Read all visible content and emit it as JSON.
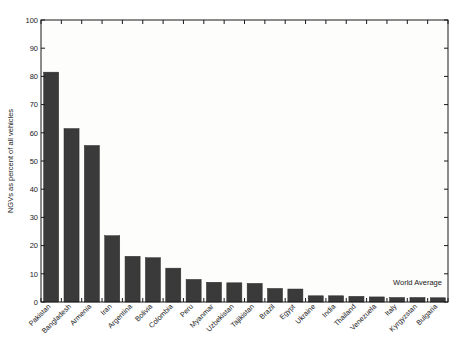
{
  "chart_data": {
    "type": "bar",
    "title": "",
    "xlabel": "",
    "ylabel": "NGVs as percent of all vehicles",
    "ylim": [
      0,
      100
    ],
    "yticks": [
      0,
      10,
      20,
      30,
      40,
      50,
      60,
      70,
      80,
      90,
      100
    ],
    "ytick_labels": [
      "0",
      "10",
      "20",
      "30",
      "40",
      "50",
      "60",
      "70",
      "80",
      "90",
      "100"
    ],
    "grid": false,
    "legend": null,
    "bar_color": "#3a3a3a",
    "categories": [
      "Pakistan",
      "Bangladesh",
      "Armenia",
      "Iran",
      "Argentina",
      "Bolivia",
      "Colombia",
      "Peru",
      "Myanmar",
      "Uzbekistan",
      "Tajikistan",
      "Brazil",
      "Egypt",
      "Ukraine",
      "India",
      "Thailand",
      "Venezuela",
      "Italy",
      "Kyrgyzstan",
      "Bulgaria"
    ],
    "values": [
      81.5,
      61.5,
      55.5,
      23.5,
      16.2,
      15.7,
      12.0,
      8.0,
      7.0,
      6.8,
      6.6,
      4.8,
      4.6,
      2.2,
      2.2,
      2.0,
      1.8,
      1.6,
      1.6,
      1.5
    ],
    "annotations": [
      {
        "text": "World Average",
        "x_category": "Kyrgyzstan",
        "y_value": 6.0
      }
    ]
  },
  "figure": {
    "background": "#ffffff",
    "plot_background": "#fdfdfc",
    "axis_color": "#1a1a1a"
  }
}
